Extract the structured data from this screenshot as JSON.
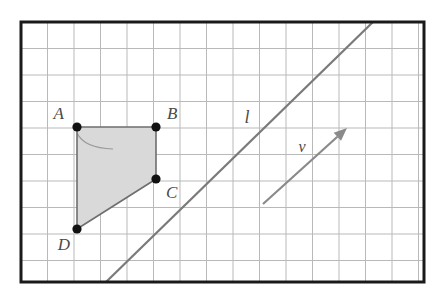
{
  "figure": {
    "width": 442,
    "height": 301,
    "background_color": "#ffffff"
  },
  "frame": {
    "x": 21,
    "y": 22,
    "width": 403,
    "height": 260,
    "border_color": "#1a1a1a",
    "border_width": 3
  },
  "grid": {
    "spacing": 26.5,
    "columns": 15,
    "rows": 10,
    "line_color": "#b9b9b9",
    "line_width": 1,
    "visible": true
  },
  "shape": {
    "name": "quadrilateral-abcd",
    "fill_color": "#d9d9d9",
    "stroke_color": "#6e6e6e",
    "stroke_width": 1.6,
    "vertices": [
      {
        "label": "A",
        "x": 77,
        "y": 127,
        "label_x": 64,
        "label_y": 119,
        "label_anchor": "end"
      },
      {
        "label": "B",
        "x": 156,
        "y": 127,
        "label_x": 167,
        "label_y": 119,
        "label_anchor": "start"
      },
      {
        "label": "C",
        "x": 156,
        "y": 179,
        "label_x": 166,
        "label_y": 198,
        "label_anchor": "start"
      },
      {
        "label": "D",
        "x": 77,
        "y": 229,
        "label_x": 70,
        "label_y": 250,
        "label_anchor": "end"
      }
    ],
    "point_radius": 4.6,
    "point_color": "#111111"
  },
  "line": {
    "name": "line-l",
    "label": "l",
    "label_x": 247,
    "label_y": 123,
    "x1": 106,
    "y1": 282,
    "x2": 373,
    "y2": 22,
    "color": "#7a7a7a",
    "width": 2.2
  },
  "vector": {
    "name": "vector-v",
    "label": "v",
    "label_x": 302,
    "label_y": 152,
    "x1": 263,
    "y1": 204,
    "x2": 347,
    "y2": 128,
    "color": "#8a8a8a",
    "width": 2.2,
    "arrow_head_length": 13
  },
  "arc": {
    "name": "corner-arc-a",
    "color": "#9a9a9a",
    "width": 1.2,
    "start_x": 77,
    "start_y": 133,
    "end_x": 113,
    "end_y": 149,
    "control_x": 84,
    "control_y": 148
  }
}
